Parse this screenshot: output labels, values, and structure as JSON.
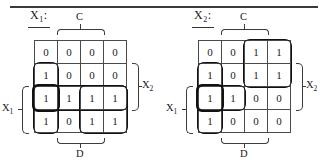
{
  "figure": {
    "type": "karnaugh-map-pair",
    "rule_color": "#3a3a3a",
    "grid_color": "#4a4a4a",
    "group_color": "#111111"
  },
  "maps": [
    {
      "id": "kmap-left",
      "title": "X",
      "title_sub": "1",
      "title_suffix": ":",
      "rows": 4,
      "cols": 4,
      "cells": [
        [
          "0",
          "0",
          "0",
          "0"
        ],
        [
          "1",
          "0",
          "0",
          "0"
        ],
        [
          "1",
          "1",
          "1",
          "1"
        ],
        [
          "1",
          "0",
          "1",
          "1"
        ]
      ],
      "brackets": {
        "top": {
          "label": "C",
          "span_cols": [
            2,
            3
          ]
        },
        "bottom": {
          "label": "D",
          "span_cols": [
            2,
            3
          ]
        },
        "right": {
          "label": "X",
          "label_sub": "2",
          "span_rows": [
            2,
            3
          ]
        },
        "left": {
          "label": "X",
          "label_sub": "1",
          "span_rows": [
            3,
            4
          ]
        }
      },
      "groups": [
        {
          "name": "column-1-rows-2-4",
          "row": 2,
          "col": 1,
          "rowspan": 3,
          "colspan": 1,
          "thick": false
        },
        {
          "name": "row-3-all-columns",
          "row": 3,
          "col": 1,
          "rowspan": 1,
          "colspan": 4,
          "thick": false
        },
        {
          "name": "rows-3-4-columns-3-4",
          "row": 3,
          "col": 3,
          "rowspan": 2,
          "colspan": 2,
          "thick": false
        },
        {
          "name": "single-cell-row3-col1",
          "row": 3,
          "col": 1,
          "rowspan": 1,
          "colspan": 1,
          "thick": true
        }
      ]
    },
    {
      "id": "kmap-right",
      "title": "X",
      "title_sub": "2",
      "title_suffix": ":",
      "rows": 4,
      "cols": 4,
      "cells": [
        [
          "0",
          "0",
          "1",
          "1"
        ],
        [
          "1",
          "0",
          "1",
          "1"
        ],
        [
          "1",
          "1",
          "0",
          "0"
        ],
        [
          "1",
          "0",
          "0",
          "0"
        ]
      ],
      "brackets": {
        "top": {
          "label": "C",
          "span_cols": [
            2,
            3
          ]
        },
        "bottom": {
          "label": "D",
          "span_cols": [
            2,
            3
          ]
        },
        "right": {
          "label": "X",
          "label_sub": "2",
          "span_rows": [
            2,
            3
          ]
        },
        "left": {
          "label": "X",
          "label_sub": "1",
          "span_rows": [
            3,
            4
          ]
        }
      },
      "groups": [
        {
          "name": "column-1-rows-2-4",
          "row": 2,
          "col": 1,
          "rowspan": 3,
          "colspan": 1,
          "thick": false
        },
        {
          "name": "row-3-columns-1-2",
          "row": 3,
          "col": 1,
          "rowspan": 1,
          "colspan": 2,
          "thick": false
        },
        {
          "name": "rows-1-2-columns-3-4",
          "row": 1,
          "col": 3,
          "rowspan": 2,
          "colspan": 2,
          "thick": false
        },
        {
          "name": "single-cell-row3-col1",
          "row": 3,
          "col": 1,
          "rowspan": 1,
          "colspan": 1,
          "thick": true
        }
      ]
    }
  ]
}
